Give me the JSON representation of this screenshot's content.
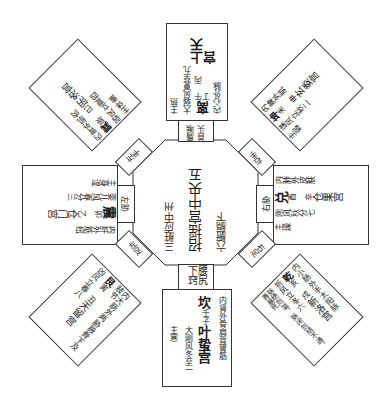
{
  "center": {
    "palace": "招摇宫中央五",
    "note1": "六腑膈下",
    "note2": "三脏应中州"
  },
  "connectors": {
    "top": "膺喉首头",
    "bottom": "腰尻下窍",
    "left": "左胁",
    "right": "右胁",
    "top_left": "左手",
    "top_right": "右手",
    "bottom_left": "左足",
    "bottom_right": "右足"
  },
  "palaces": {
    "top": {
      "trigram": "离",
      "branches": "午 丙 丁",
      "name": "上天宫",
      "wind": "大弱风",
      "term": "夏至九",
      "organs": "内心外脉",
      "governs": "主热"
    },
    "bottom": {
      "trigram": "坎",
      "branches": "壬子",
      "name": "叶蛰宫",
      "wind": "大刚风",
      "term": "冬至一",
      "organs": "内肾外骨肩背膂筋",
      "governs": "主寒"
    },
    "left": {
      "trigram": "震",
      "branches": "卯 乙",
      "name": "仓门宫",
      "wind": "婴儿风",
      "term": "春分三",
      "organs": "内肝外筋纽",
      "governs": "主身湿"
    },
    "right": {
      "trigram": "兑",
      "branches": "酉 辛",
      "name": "仓果宫",
      "wind": "刚风",
      "term": "秋分七",
      "organs": "内肺外皮肤",
      "governs": "主燥"
    },
    "top_left": {
      "trigram": "巽",
      "branches": "辰 巳",
      "name": "阴洛宫",
      "wind": "弱风",
      "term": "立夏四",
      "organs": "内胃外肌肉",
      "governs": "主体重"
    },
    "top_right": {
      "trigram": "坤",
      "branches": "未 申",
      "name": "玄委宫",
      "wind": "谋风",
      "term": "立秋二",
      "organs": "内脾外肌",
      "governs": "主弱"
    },
    "bottom_left": {
      "trigram": "艮",
      "branches": "寅 丑",
      "name": "天留宫",
      "wind": "凶风",
      "term": "立春八",
      "organs": "内大肠外两胁腋骨下及肢节",
      "governs": ""
    },
    "bottom_right": {
      "trigram": "乾",
      "branches": "亥 戌",
      "name": "新洛宫",
      "wind": "折风",
      "term": "立冬六",
      "organs": "内小肠外手太阳脉",
      "governs": "脉绝则溢，脉闭则结不通，善暴死"
    }
  }
}
